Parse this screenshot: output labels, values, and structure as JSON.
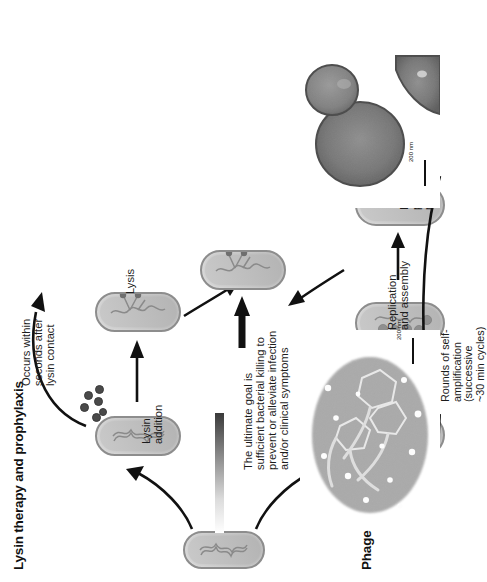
{
  "figure": {
    "title_phage": "Phage therapy",
    "title_lysin": "Lysin therapy and prophylaxis",
    "orientation": "rotated-90-ccw"
  },
  "phage_pathway": {
    "steps": [
      {
        "id": "infection",
        "label": "Infection"
      },
      {
        "id": "replication",
        "label": "Replication\nand assembly"
      },
      {
        "id": "lysis_release",
        "label": "Lysis and\nprogeny\nrelease"
      }
    ],
    "cycle_note": "Rounds of self-\namplification\n(successive\n~30 min cycles)"
  },
  "lysin_pathway": {
    "steps": [
      {
        "id": "lysin_addition",
        "label": "Lysin\naddition"
      },
      {
        "id": "lysis",
        "label": "Lysis"
      }
    ],
    "speed_note": "Occurs within\nseconds after\nlysin contact"
  },
  "outcome": {
    "text": "The ultimate goal is\nsufficient bacterial killing to\nprevent or alleviate infection\nand/or clinical symptoms"
  },
  "micrographs": [
    {
      "id": "lysin-em",
      "scale_label": "200 nm",
      "caption": ""
    },
    {
      "id": "phage-em",
      "scale_label": "200 nm",
      "caption": ""
    }
  ],
  "colors": {
    "cell_fill": "#bdbdbd",
    "cell_stroke": "#8d8d8d",
    "lysin_dot": "#4a4a4a",
    "arrow": "#111111",
    "text": "#1a1a1a"
  }
}
